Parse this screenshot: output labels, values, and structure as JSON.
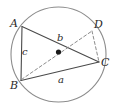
{
  "figure": {
    "canvas": {
      "width": 116,
      "height": 109
    },
    "colors": {
      "background": "#ffffff",
      "circle_stroke": "#8c8c8c",
      "solid_stroke": "#4a4a4a",
      "dashed_stroke": "#8c8c8c",
      "center_dot": "#1a1a1a",
      "label_color": "#2b2b2b"
    },
    "circle": {
      "name": "circumscribed-circle",
      "cx": 58.5,
      "cy": 54.5,
      "r": 47.5
    },
    "center_point": {
      "name": "circle-center-dot",
      "x": 58.5,
      "y": 52.0,
      "radius": 2.6
    },
    "vertices": [
      {
        "id": "A",
        "label": "A",
        "x": 22.0,
        "y": 26.5,
        "label_x": 10,
        "label_y": 18
      },
      {
        "id": "B",
        "label": "B",
        "x": 21.0,
        "y": 80.5,
        "label_x": 10,
        "label_y": 80
      },
      {
        "id": "C",
        "label": "C",
        "x": 99.0,
        "y": 62.0,
        "label_x": 101,
        "label_y": 57
      },
      {
        "id": "D",
        "label": "D",
        "x": 92.0,
        "y": 31.0,
        "label_x": 94,
        "label_y": 19
      }
    ],
    "solid_segments": [
      {
        "name": "segment-AB",
        "from": "A",
        "to": "B",
        "x1": 22.0,
        "y1": 26.5,
        "x2": 21.0,
        "y2": 80.5
      },
      {
        "name": "segment-BC",
        "from": "B",
        "to": "C",
        "x1": 21.0,
        "y1": 80.5,
        "x2": 99.0,
        "y2": 62.0
      },
      {
        "name": "segment-AC",
        "from": "A",
        "to": "C",
        "x1": 22.0,
        "y1": 26.5,
        "x2": 99.0,
        "y2": 62.0
      }
    ],
    "dashed_segments": [
      {
        "name": "segment-B-to-D-through-center",
        "from": "B",
        "to": "D",
        "x1": 21.5,
        "y1": 79.5,
        "x2": 92.0,
        "y2": 31.0
      },
      {
        "name": "segment-DC",
        "from": "D",
        "to": "C",
        "x1": 92.0,
        "y1": 31.0,
        "x2": 99.0,
        "y2": 62.0
      }
    ],
    "side_labels": [
      {
        "id": "c",
        "label": "c",
        "segment": "AB",
        "x": 22,
        "y": 47
      },
      {
        "id": "a",
        "label": "a",
        "segment": "BC",
        "x": 58,
        "y": 75
      },
      {
        "id": "b",
        "label": "b",
        "segment": "AC",
        "x": 57,
        "y": 33
      }
    ]
  }
}
